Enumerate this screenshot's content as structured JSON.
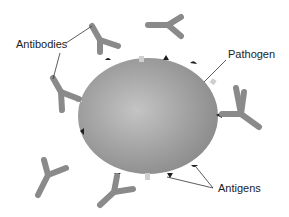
{
  "diagram": {
    "labels": {
      "antibodies": "Antibodies",
      "pathogen": "Pathogen",
      "antigens": "Antigens"
    },
    "colors": {
      "background": "#ffffff",
      "antibody": "#8a8a8a",
      "pathogen_light": "#c2c2c2",
      "pathogen_dark": "#8c8c8c",
      "antigen_dark": "#1e1e1e",
      "receptor_light": "#cfcfcf",
      "leader_line": "#333333",
      "text": "#222222"
    }
  }
}
